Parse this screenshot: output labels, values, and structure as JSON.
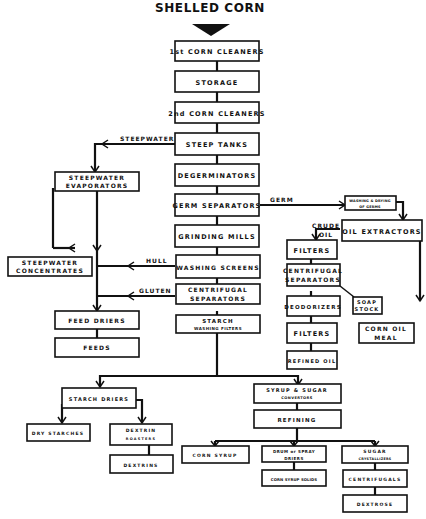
{
  "title": "SHELLED CORN",
  "nodes": {
    "corn_cleaners_1": {
      "label1": "1st CORN CLEANERS",
      "label2": ""
    },
    "storage": {
      "label1": "STORAGE",
      "label2": ""
    },
    "corn_cleaners_2": {
      "label1": "2nd CORN CLEANERS",
      "label2": ""
    },
    "steep_tanks": {
      "label1": "STEEP TANKS",
      "label2": ""
    },
    "steepwater_evaporators": {
      "label1": "STEEPWATER",
      "label2": "EVAPORATORS"
    },
    "degerminators": {
      "label1": "DEGERMINATORS",
      "label2": ""
    },
    "germ_separators": {
      "label1": "GERM SEPARATORS",
      "label2": ""
    },
    "washing_drying_germs": {
      "label1": "WASHING & DRYING",
      "label2": "OF GERMS"
    },
    "oil_extractors": {
      "label1": "OIL EXTRACTORS",
      "label2": ""
    },
    "grinding_mills": {
      "label1": "GRINDING MILLS",
      "label2": ""
    },
    "filters_1": {
      "label1": "FILTERS",
      "label2": ""
    },
    "steepwater_concentrates": {
      "label1": "STEEPWATER",
      "label2": "CONCENTRATES"
    },
    "washing_screens": {
      "label1": "WASHING SCREENS",
      "label2": ""
    },
    "centrifugal_separators_oil": {
      "label1": "CENTRIFUGAL",
      "label2": "SEPARATORS"
    },
    "centrifugal_separators": {
      "label1": "CENTRIFUGAL",
      "label2": "SEPARATORS"
    },
    "deodorizers": {
      "label1": "DEODORIZERS",
      "label2": ""
    },
    "soap_stock": {
      "label1": "SOAP",
      "label2": "STOCK"
    },
    "feed_driers": {
      "label1": "FEED DRIERS",
      "label2": ""
    },
    "starch_washing_filters": {
      "label1": "STARCH",
      "label2": "WASHING FILTERS"
    },
    "filters_2": {
      "label1": "FILTERS",
      "label2": ""
    },
    "corn_oil_meal": {
      "label1": "CORN OIL",
      "label2": "MEAL"
    },
    "feeds": {
      "label1": "FEEDS",
      "label2": ""
    },
    "refined_oil": {
      "label1": "REFINED OIL",
      "label2": ""
    },
    "starch_driers": {
      "label1": "STARCH DRIERS",
      "label2": ""
    },
    "syrup_sugar_convertors": {
      "label1": "SYRUP & SUGAR",
      "label2": "CONVERTORS"
    },
    "refining": {
      "label1": "REFINING",
      "label2": ""
    },
    "dry_starches": {
      "label1": "DRY STARCHES",
      "label2": ""
    },
    "dextrin_roasters": {
      "label1": "DEXTRIN",
      "label2": "ROASTERS"
    },
    "corn_syrup": {
      "label1": "CORN SYRUP",
      "label2": ""
    },
    "drum_spray_driers": {
      "label1": "DRUM or SPRAY",
      "label2": "DRIERS"
    },
    "sugar_crystallizers": {
      "label1": "SUGAR",
      "label2": "CRYSTALLIZERS"
    },
    "dextrins": {
      "label1": "DEXTRINS",
      "label2": ""
    },
    "corn_syrup_solids": {
      "label1": "CORN SYRUP SOLIDS",
      "label2": ""
    },
    "centrifugals": {
      "label1": "CENTRIFUGALS",
      "label2": ""
    },
    "dextrose": {
      "label1": "DEXTROSE",
      "label2": ""
    }
  },
  "edge_labels": {
    "steepwater": "STEEPWATER",
    "germ": "GERM",
    "crude": "CRUDE",
    "oil": "OIL",
    "hull": "HULL",
    "gluten": "GLUTEN"
  }
}
